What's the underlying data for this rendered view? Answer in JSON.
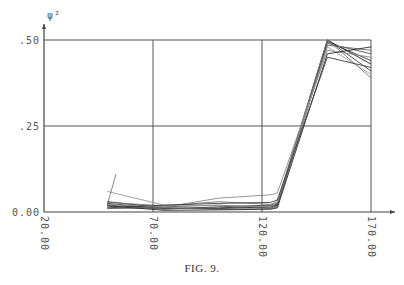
{
  "chart_data": {
    "type": "line",
    "title": "",
    "xlabel": "",
    "ylabel": "ψ²",
    "xlim": [
      20,
      175
    ],
    "ylim": [
      0,
      0.5
    ],
    "grid": true,
    "xticks": [
      20,
      70,
      120,
      170
    ],
    "xtick_labels": [
      "20.00",
      "70.00",
      "120.00",
      "170.00"
    ],
    "yticks": [
      0,
      0.25,
      0.5
    ],
    "ytick_labels": [
      "0.00",
      ".25",
      ".50"
    ],
    "x": [
      49,
      75,
      100,
      124,
      127,
      150,
      170
    ],
    "series": [
      {
        "name": "run-1",
        "values": [
          0.03,
          0.012,
          0.01,
          0.015,
          0.02,
          0.5,
          0.43
        ]
      },
      {
        "name": "run-2",
        "values": [
          0.025,
          0.01,
          0.012,
          0.018,
          0.022,
          0.495,
          0.44
        ]
      },
      {
        "name": "run-3",
        "values": [
          0.02,
          0.008,
          0.015,
          0.02,
          0.025,
          0.5,
          0.41
        ]
      },
      {
        "name": "run-4",
        "values": [
          0.015,
          0.015,
          0.02,
          0.012,
          0.018,
          0.49,
          0.46
        ]
      },
      {
        "name": "run-5",
        "values": [
          0.01,
          0.012,
          0.008,
          0.01,
          0.015,
          0.485,
          0.47
        ]
      },
      {
        "name": "run-6",
        "values": [
          0.028,
          0.018,
          0.03,
          0.022,
          0.03,
          0.5,
          0.39
        ]
      },
      {
        "name": "run-7",
        "values": [
          0.022,
          0.014,
          0.04,
          0.05,
          0.055,
          0.47,
          0.45
        ]
      },
      {
        "name": "run-8",
        "values": [
          0.06,
          0.02,
          0.018,
          0.016,
          0.028,
          0.48,
          0.4
        ]
      },
      {
        "name": "run-9",
        "values": [
          0.018,
          0.005,
          0.006,
          0.008,
          0.012,
          0.46,
          0.48
        ]
      },
      {
        "name": "run-10",
        "values": [
          0.012,
          0.02,
          0.025,
          0.028,
          0.035,
          0.45,
          0.42
        ]
      }
    ]
  },
  "caption": "FIG. 9."
}
